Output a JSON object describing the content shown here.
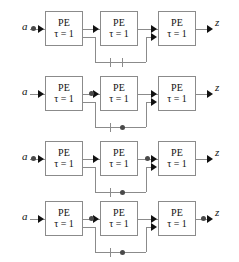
{
  "figure": {
    "type": "block-diagram",
    "row_count": 4,
    "stages_per_row": 3
  },
  "labels": {
    "input": "a",
    "output": "z",
    "pe": "PE",
    "tau": "τ = 1"
  },
  "colors": {
    "box_border": "#8b8b8b",
    "wire": "#8b8b8b",
    "arrow": "#111111",
    "dot": "#4a4a4a",
    "text": "#111111",
    "background": "#ffffff"
  },
  "rows": [
    {
      "id": "row-1",
      "input": "a",
      "output": "z",
      "stages": [
        {
          "name": "PE",
          "delay": "τ = 1"
        },
        {
          "name": "PE",
          "delay": "τ = 1"
        },
        {
          "name": "PE",
          "delay": "τ = 1"
        }
      ],
      "dots": [
        "input-line"
      ],
      "feedback": "stage1-to-stage3",
      "tick_count": 2
    },
    {
      "id": "row-2",
      "input": "a",
      "output": "z",
      "stages": [
        {
          "name": "PE",
          "delay": "τ = 1"
        },
        {
          "name": "PE",
          "delay": "τ = 1"
        },
        {
          "name": "PE",
          "delay": "τ = 1"
        }
      ],
      "dots": [
        "stage1-stage2-link",
        "feedback-bus"
      ],
      "feedback": "stage1-to-stage3",
      "tick_count": 1
    },
    {
      "id": "row-3",
      "input": "a",
      "output": "z",
      "stages": [
        {
          "name": "PE",
          "delay": "τ = 1"
        },
        {
          "name": "PE",
          "delay": "τ = 1"
        },
        {
          "name": "PE",
          "delay": "τ = 1"
        }
      ],
      "dots": [
        "input-line",
        "stage2-stage3-link",
        "feedback-bus"
      ],
      "feedback": "stage1-to-stage3",
      "tick_count": 1
    },
    {
      "id": "row-4",
      "input": "a",
      "output": "z",
      "stages": [
        {
          "name": "PE",
          "delay": "τ = 1"
        },
        {
          "name": "PE",
          "delay": "τ = 1"
        },
        {
          "name": "PE",
          "delay": "τ = 1"
        }
      ],
      "dots": [
        "stage1-stage2-link",
        "output-line",
        "feedback-bus"
      ],
      "feedback": "stage1-to-stage3",
      "tick_count": 1
    }
  ]
}
